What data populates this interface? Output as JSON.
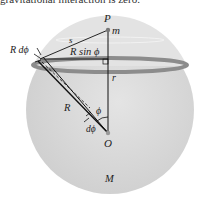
{
  "caption": "gravitational interaction is zero.",
  "diagram": {
    "labels": {
      "P": "P",
      "m": "m",
      "s": "s",
      "R_dphi": "R dϕ",
      "R_sin_phi": "R sin ϕ",
      "r": "r",
      "R": "R",
      "phi": "ϕ",
      "dphi": "dϕ",
      "O": "O",
      "M": "M"
    },
    "colors": {
      "sphere_fill": "#d9d9d9",
      "cap_fill": "#e6e6e6",
      "band": "#8c8c8c",
      "line": "#111111"
    }
  }
}
